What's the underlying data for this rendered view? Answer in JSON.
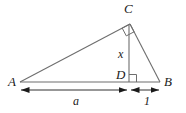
{
  "figure": {
    "type": "geometry-diagram",
    "background_color": "#ffffff",
    "line_color": "#6e6e6e",
    "dimension_color": "#1a1a1a",
    "text_color": "#1a1a1a"
  },
  "vertices": {
    "a": {
      "label": "A",
      "x": 20,
      "y": 82,
      "label_x": 8,
      "label_y": 86
    },
    "b": {
      "label": "B",
      "x": 160,
      "y": 82,
      "label_x": 164,
      "label_y": 86
    },
    "c": {
      "label": "C",
      "x": 130,
      "y": 24,
      "label_x": 124,
      "label_y": 13
    },
    "d": {
      "label": "D",
      "x": 129,
      "y": 82,
      "label_x": 116,
      "label_y": 79
    }
  },
  "segments": [
    {
      "name": "side-ac",
      "from": "A",
      "to": "C"
    },
    {
      "name": "side-cb",
      "from": "C",
      "to": "B"
    },
    {
      "name": "side-ab",
      "from": "A",
      "to": "B"
    },
    {
      "name": "altitude-cd",
      "from": "C",
      "to": "D"
    }
  ],
  "right_angles": [
    {
      "name": "right-angle-at-c",
      "vertex": "C"
    },
    {
      "name": "right-angle-at-d",
      "vertex": "D"
    }
  ],
  "measures": {
    "altitude": {
      "label": "x",
      "x": 120,
      "y": 58
    },
    "segment_ad": {
      "label": "a",
      "x": 73,
      "y": 105
    },
    "segment_db": {
      "label": "1",
      "x": 145,
      "y": 105
    }
  },
  "dimension_lines": [
    {
      "name": "dimension-a",
      "from_x": 20,
      "to_x": 128,
      "y": 90,
      "label": "a"
    },
    {
      "name": "dimension-1",
      "from_x": 130,
      "to_x": 160,
      "y": 90,
      "label": "1"
    }
  ]
}
